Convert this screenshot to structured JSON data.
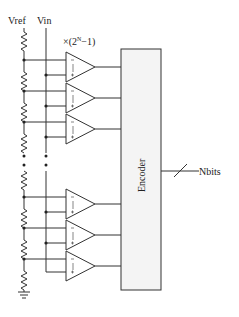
{
  "labels": {
    "vref": "Vref",
    "vin": "Vin",
    "multiplier": "×(2",
    "multiplier_sup": "N",
    "multiplier_tail": "−1)",
    "encoder": "Encoder",
    "output": "Nbits"
  },
  "colors": {
    "line": "#333333",
    "encoder_fill": "#f4f4f4"
  },
  "comparators": {
    "top_group_count": 3,
    "bottom_group_count": 3,
    "ellipsis": "⋮"
  }
}
